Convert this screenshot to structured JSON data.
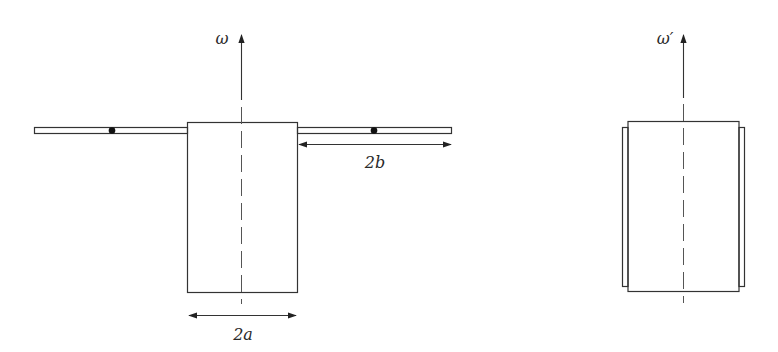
{
  "figures": {
    "left": {
      "axis_label": "ω",
      "width_label": "2a",
      "rod_label": "2b",
      "point_masses": 2
    },
    "right": {
      "axis_label": "ω′"
    }
  },
  "colors": {
    "line": "#333333",
    "dot": "#111111",
    "background": "#ffffff"
  }
}
